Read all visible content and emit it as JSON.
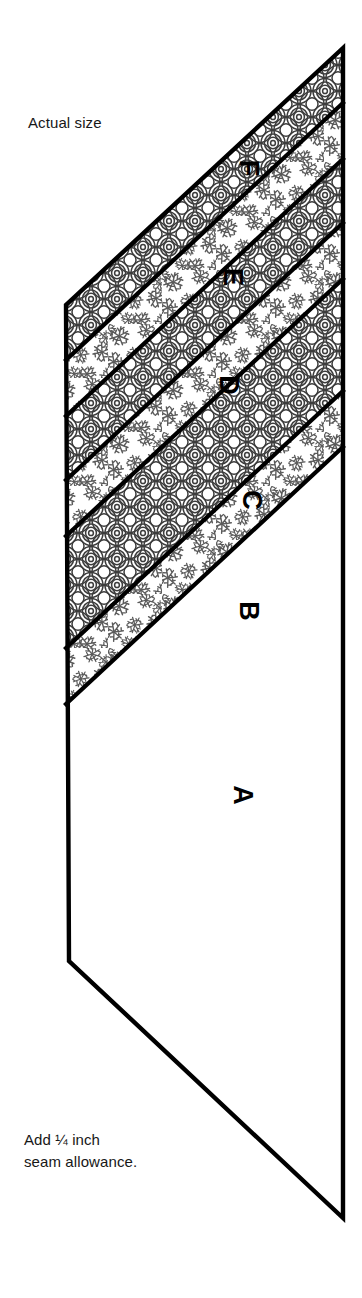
{
  "document": {
    "kind": "sewing-pattern-piece",
    "title_text": "Actual size",
    "note_text": "Add ¼ inch\nseam allowance."
  },
  "figure": {
    "name": "strip-pieced-parallelogram",
    "outline_color": "#000000",
    "fill_color": "#ffffff",
    "pattern_ink_color": "#4a4a4a",
    "vertices": [
      {
        "x": 343,
        "y": 48
      },
      {
        "x": 66,
        "y": 305
      },
      {
        "x": 69,
        "y": 961
      },
      {
        "x": 343,
        "y": 1218
      }
    ],
    "bands": [
      {
        "id": "F",
        "label": "F",
        "fabric": "concentric-circles",
        "label_x": 249,
        "label_y": 168
      },
      {
        "id": "E",
        "label": "E",
        "fabric": "floral-sprig",
        "label_x": 233,
        "label_y": 277
      },
      {
        "id": "D",
        "label": "D",
        "fabric": "concentric-circles",
        "label_x": 229,
        "label_y": 385
      },
      {
        "id": "C",
        "label": "C",
        "fabric": "floral-sprig",
        "label_x": 252,
        "label_y": 500
      },
      {
        "id": "B",
        "label": "B",
        "fabric": "concentric-circles",
        "label_x": 249,
        "label_y": 611
      },
      {
        "id": "A",
        "label": "A",
        "fabric": "floral-sprig",
        "label_x": 243,
        "label_y": 795
      }
    ],
    "seam_lines": [
      {
        "from_left_y": 305,
        "to_right_y": 48
      },
      {
        "from_left_y": 360,
        "to_right_y": 103
      },
      {
        "from_left_y": 416,
        "to_right_y": 159
      },
      {
        "from_left_y": 480,
        "to_right_y": 223
      },
      {
        "from_left_y": 536,
        "to_right_y": 279
      },
      {
        "from_left_y": 648,
        "to_right_y": 391
      },
      {
        "from_left_y": 704,
        "to_right_y": 447
      },
      {
        "from_left_y": 961,
        "to_right_y": 704
      }
    ],
    "label_rotation_degrees": 90
  }
}
